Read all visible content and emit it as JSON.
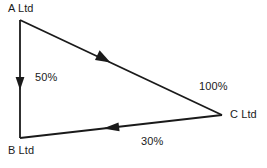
{
  "diagram": {
    "type": "directed-graph-triangle",
    "background_color": "#ffffff",
    "stroke_color": "#1a1a1a",
    "nodes": [
      {
        "id": "A",
        "label": "A Ltd",
        "x": 20,
        "y": 20
      },
      {
        "id": "B",
        "label": "B Ltd",
        "x": 20,
        "y": 138
      },
      {
        "id": "C",
        "label": "C Ltd",
        "x": 222,
        "y": 115
      }
    ],
    "edges": [
      {
        "id": "A-B",
        "from": "A",
        "to": "B",
        "label": "50%",
        "direction": "down"
      },
      {
        "id": "A-C",
        "from": "A",
        "to": "C",
        "label": "100%",
        "direction": "down-right"
      },
      {
        "id": "C-B",
        "from": "C",
        "to": "B",
        "label": "30%",
        "direction": "left"
      }
    ]
  },
  "labels": {
    "node_a": "A Ltd",
    "node_b": "B Ltd",
    "node_c": "C Ltd",
    "edge_ab": "50%",
    "edge_ac": "100%",
    "edge_cb": "30%"
  }
}
